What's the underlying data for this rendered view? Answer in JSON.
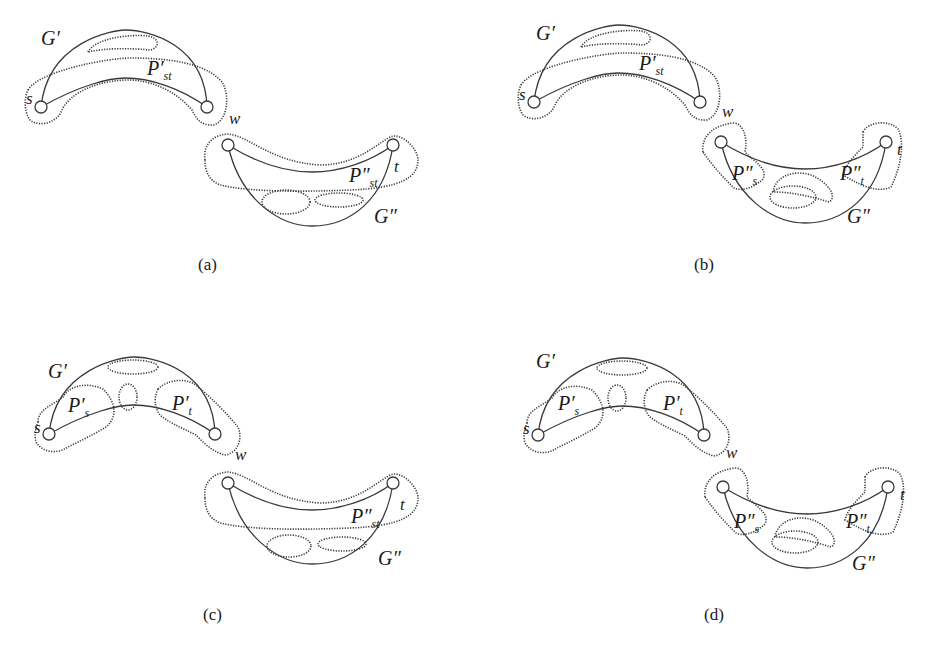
{
  "figure": {
    "panels": [
      {
        "id": "a",
        "caption": "(a)",
        "upper": {
          "graph_label": "G′",
          "vertex_left": "s",
          "vertex_right": "w",
          "path_label_base": "P′",
          "path_label_sub": "st"
        },
        "lower": {
          "graph_label": "G″",
          "vertex_right": "t",
          "path_label_base": "P″",
          "path_label_sub": "st"
        }
      },
      {
        "id": "b",
        "caption": "(b)",
        "upper": {
          "graph_label": "G′",
          "vertex_left": "s",
          "vertex_right": "w",
          "path_label_base": "P′",
          "path_label_sub": "st"
        },
        "lower": {
          "graph_label": "G″",
          "vertex_right": "t",
          "left_label_base": "P″",
          "left_label_sub": "s",
          "right_label_base": "P″",
          "right_label_sub": "t"
        }
      },
      {
        "id": "c",
        "caption": "(c)",
        "upper": {
          "graph_label": "G′",
          "vertex_left": "s",
          "vertex_right": "w",
          "left_label_base": "P′",
          "left_label_sub": "s",
          "right_label_base": "P′",
          "right_label_sub": "t"
        },
        "lower": {
          "graph_label": "G″",
          "vertex_right": "t",
          "path_label_base": "P″",
          "path_label_sub": "st"
        }
      },
      {
        "id": "d",
        "caption": "(d)",
        "upper": {
          "graph_label": "G′",
          "vertex_left": "s",
          "vertex_right": "w",
          "left_label_base": "P′",
          "left_label_sub": "s",
          "right_label_base": "P′",
          "right_label_sub": "t"
        },
        "lower": {
          "graph_label": "G″",
          "vertex_right": "t",
          "left_label_base": "P″",
          "left_label_sub": "s",
          "right_label_base": "P″",
          "right_label_sub": "t"
        }
      }
    ],
    "colors": {
      "stroke": "#3a3a3a",
      "text": "#1a1a1a",
      "background": "#ffffff"
    }
  }
}
